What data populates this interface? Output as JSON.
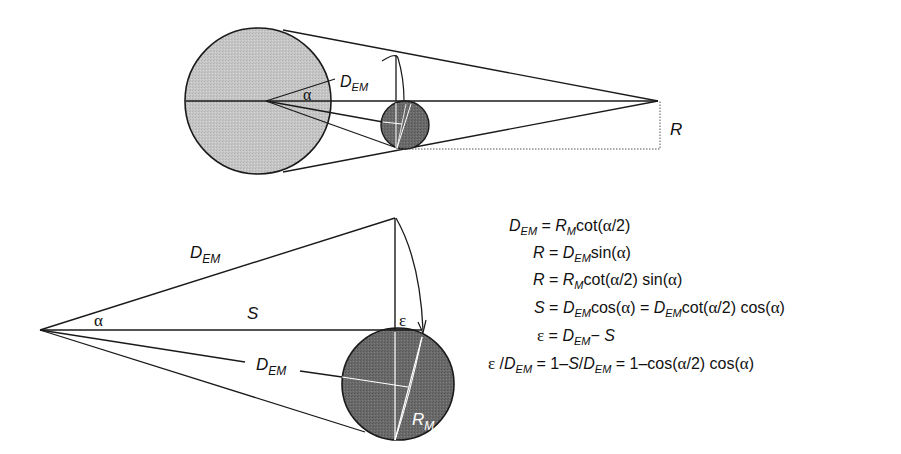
{
  "top_diagram": {
    "labels": {
      "d_em": "D",
      "d_em_sub": "EM",
      "alpha": "α",
      "r": "R"
    },
    "colors": {
      "earth_fill": "#c4c4c4",
      "moon_fill": "#6e6e6e",
      "stroke": "#1a1a1a"
    }
  },
  "bottom_diagram": {
    "labels": {
      "d_em_top": "D",
      "d_em_top_sub": "EM",
      "s": "S",
      "alpha": "α",
      "epsilon": "ε",
      "d_em_lower": "D",
      "d_em_lower_sub": "EM",
      "r_m": "R",
      "r_m_sub": "M"
    },
    "colors": {
      "moon_fill": "#6a6a6a",
      "stroke": "#1a1a1a"
    }
  },
  "equations": [
    {
      "id": "eq1",
      "text": "D_EM = R_M cot(α/2)"
    },
    {
      "id": "eq2",
      "text": "R = D_EM sin(α)"
    },
    {
      "id": "eq3",
      "text": "R = R_M cot(α/2) sin(α)"
    },
    {
      "id": "eq4",
      "text": "S = D_EM cos(α) = D_EM cot(α/2) cos(α)"
    },
    {
      "id": "eq5",
      "text": "ε = D_EM − S"
    },
    {
      "id": "eq6",
      "text": "ε / D_EM = 1 − S/D_EM = 1 − cos(α/2) cos(α)"
    }
  ],
  "eq_parts": {
    "eq1": {
      "lhs": "D",
      "lhs_sub": "EM",
      "eq": " = ",
      "r": "R",
      "r_sub": "M",
      "rest": "cot(",
      "a": "α",
      "tail": "/2)"
    },
    "eq2": {
      "lhs": "R",
      "eq": " = ",
      "d": "D",
      "d_sub": "EM",
      "rest": "sin(",
      "a": "α",
      "tail": ")"
    },
    "eq3": {
      "lhs": "R",
      "eq": " = ",
      "r": "R",
      "r_sub": "M",
      "rest": "cot(",
      "a": "α",
      "mid": "/2) sin(",
      "a2": "α",
      "tail": ")"
    },
    "eq4": {
      "lhs": "S",
      "eq": " = ",
      "d": "D",
      "d_sub": "EM",
      "rest": "cos(",
      "a": "α",
      "mid": ") = ",
      "d2": "D",
      "d2_sub": "EM",
      "rest2": "cot(",
      "a2": "α",
      "mid2": "/2) cos(",
      "a3": "α",
      "tail": ")"
    },
    "eq5": {
      "lhs": "ε",
      "eq": " = ",
      "d": "D",
      "d_sub": "EM",
      "minus": "− ",
      "s": "S"
    },
    "eq6": {
      "lhs": "ε",
      "slash": " /",
      "d": "D",
      "d_sub": "EM",
      "eq": " = 1–",
      "s": "S",
      "slash2": "/",
      "d2": "D",
      "d2_sub": "EM",
      "mid": " = 1–cos(",
      "a": "α",
      "mid2": "/2) cos(",
      "a2": "α",
      "tail": ")"
    }
  }
}
